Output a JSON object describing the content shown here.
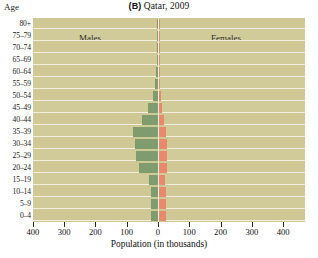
{
  "figure": {
    "panel_tag": "(B)",
    "title_text": "Qatar, 2009",
    "axis_corner_label": "Age",
    "xlabel": "Population (in thousands)",
    "group_label_males": "Males",
    "group_label_females": "Females"
  },
  "colors": {
    "plot_background": "#cfc894",
    "male_bar": "#7f9c6e",
    "female_bar": "#e8896b",
    "gridline": "#f3efe0",
    "page_background": "#ffffff",
    "text": "#111111"
  },
  "chart_data": {
    "type": "bar",
    "subtype": "population-pyramid",
    "title": "(B) Qatar, 2009",
    "xlabel": "Population (in thousands)",
    "ylabel": "Age",
    "orientation": "horizontal",
    "grid": true,
    "legend_position": "inside-top",
    "xlim": [
      -400,
      400
    ],
    "xticks": [
      -400,
      -300,
      -200,
      -100,
      0,
      100,
      200,
      300,
      400
    ],
    "xticklabels": [
      "400",
      "300",
      "200",
      "100",
      "0",
      "100",
      "200",
      "300",
      "400"
    ],
    "xtick_unit": "thousands",
    "categories": [
      "80+",
      "75-79",
      "70-74",
      "65-69",
      "60-64",
      "55-59",
      "50-54",
      "45-49",
      "40-44",
      "35-39",
      "30-34",
      "25-29",
      "20-24",
      "15-19",
      "10-14",
      "5-9",
      "0-4"
    ],
    "series": [
      {
        "name": "Males",
        "side": "left",
        "color": "#7f9c6e",
        "values": [
          1,
          1,
          2,
          3,
          5,
          9,
          17,
          33,
          52,
          80,
          74,
          71,
          62,
          28,
          22,
          22,
          23
        ]
      },
      {
        "name": "Females",
        "side": "right",
        "color": "#e8896b",
        "values": [
          1,
          1,
          1,
          2,
          3,
          4,
          7,
          11,
          16,
          22,
          25,
          26,
          24,
          18,
          21,
          21,
          22
        ]
      }
    ]
  }
}
